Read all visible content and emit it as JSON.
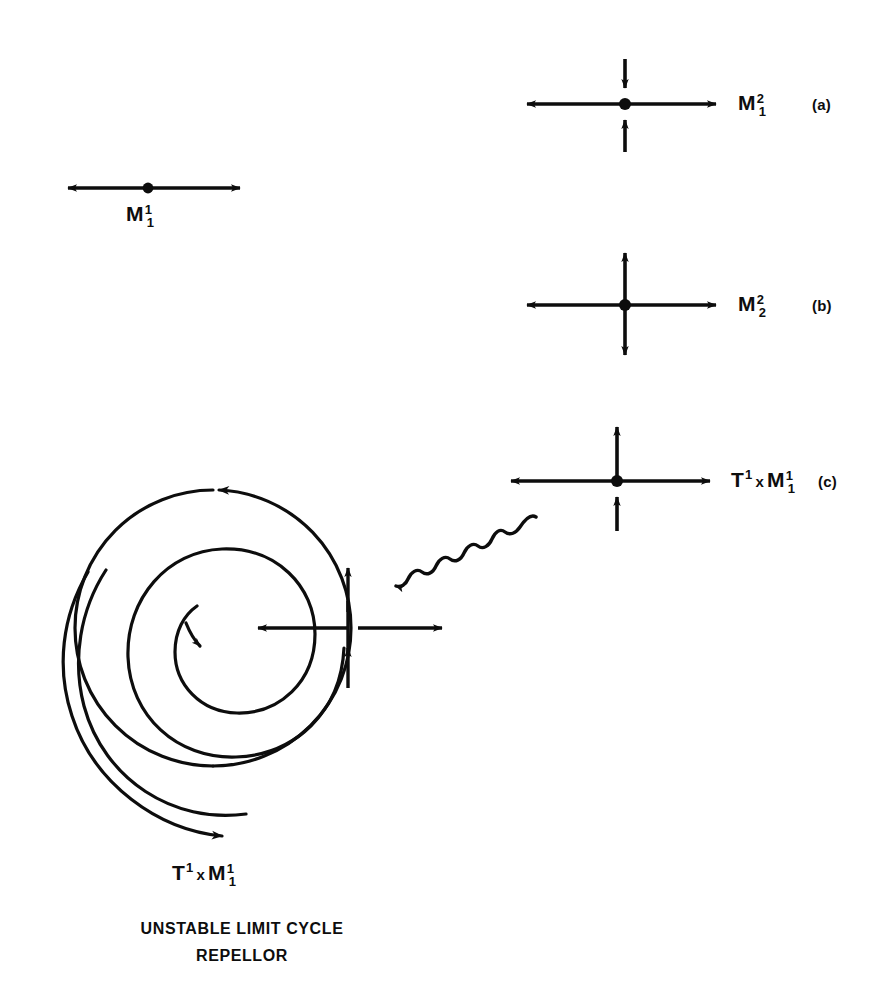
{
  "figure": {
    "background_color": "#ffffff",
    "ink_color": "#0d0d0d",
    "width": 872,
    "height": 993
  },
  "panels": [
    {
      "id": "a",
      "tag": "(a)",
      "label": {
        "base": "M",
        "sup": "2",
        "sub": "1",
        "text": "M²₁"
      },
      "type": "saddle-cross",
      "description": "Horizontal arrows point outward, vertical arrows point inward toward the fixed point",
      "horizontal_arrows": "outward",
      "vertical_arrows": "inward",
      "center": {
        "x": 625,
        "y": 104
      }
    },
    {
      "id": "b",
      "tag": "(b)",
      "label": {
        "base": "M",
        "sup": "2",
        "sub": "2",
        "text": "M²₂"
      },
      "type": "source-cross",
      "description": "Horizontal arrows point outward, vertical arrows point outward from the fixed point",
      "horizontal_arrows": "outward",
      "vertical_arrows": "outward",
      "center": {
        "x": 625,
        "y": 305
      }
    },
    {
      "id": "c",
      "tag": "(c)",
      "label": {
        "base": "T",
        "sup": "1",
        "times": "x",
        "base2": "M",
        "sup2": "1",
        "sub2": "1",
        "text": "T¹ x M¹₁"
      },
      "type": "torus-cross",
      "description": "Horizontal arrows point outward, both vertical arrows point upward along the cycle direction",
      "horizontal_arrows": "outward",
      "vertical_arrows": "both-up",
      "center": {
        "x": 617,
        "y": 481
      }
    }
  ],
  "line_manifold": {
    "label": {
      "base": "M",
      "sup": "1",
      "sub": "1",
      "text": "M¹₁"
    },
    "description": "A one dimensional unstable manifold: a point on a line with arrows pointing outward in both directions",
    "center": {
      "x": 148,
      "y": 188
    }
  },
  "limit_cycle": {
    "label": {
      "base": "T",
      "sup": "1",
      "times": "x",
      "base2": "M",
      "sup2": "1",
      "sub2": "1",
      "text": "T¹ x M¹₁"
    },
    "caption_lines": [
      "UNSTABLE LIMIT CYCLE",
      "REPELLOR"
    ],
    "description": "An unstable limit cycle drawn as a circle with an inward spiral collapsing to the centre and an outward spiral escaping to the lower left",
    "cycle_center": {
      "x": 213,
      "y": 628
    },
    "cycle_radius": 138,
    "flow_direction": "counterclockwise",
    "cross_marker": {
      "x": 348,
      "y": 628,
      "description": "Transverse cross on the cycle: arrow inward to the left, arrow outward to the right, both vertical arrows point up"
    }
  },
  "connector": {
    "type": "wavy-arrow",
    "description": "Wavy arrow linking the (c) cross diagram down-left to the cross marker on the limit cycle",
    "from": {
      "x": 535,
      "y": 518
    },
    "to": {
      "x": 390,
      "y": 590
    },
    "arrowhead": "lower-left"
  }
}
